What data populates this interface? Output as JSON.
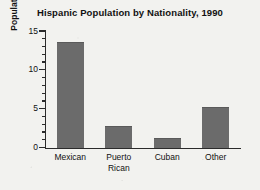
{
  "chart_data": {
    "type": "bar",
    "title": "Hispanic Population by Nationality, 1990",
    "xlabel": "",
    "ylabel": "Population in millions",
    "categories": [
      "Mexican",
      "Puerto Rican",
      "Cuban",
      "Other"
    ],
    "category_lines": [
      [
        "Mexican"
      ],
      [
        "Puerto",
        "Rican"
      ],
      [
        "Cuban"
      ],
      [
        "Other"
      ]
    ],
    "values": [
      13.5,
      2.7,
      1.1,
      5.1
    ],
    "ylim": [
      0,
      15
    ],
    "ytick_labels": [
      "0",
      "5",
      "10",
      "15"
    ],
    "ytick_values": [
      0,
      5,
      10,
      15
    ],
    "minor_tick_interval": 1,
    "grid": false,
    "legend": null,
    "bar_color": "#6b6b6b",
    "axis_color": "#2b2b2b",
    "background_color": "#f2f2ef"
  }
}
